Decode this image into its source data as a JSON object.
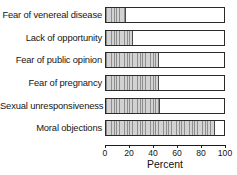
{
  "chart_data": {
    "type": "bar",
    "orientation": "horizontal",
    "title": "",
    "xlabel": "Percent",
    "ylabel": "",
    "xlim": [
      0,
      100
    ],
    "xticks": [
      0,
      20,
      40,
      60,
      80,
      100
    ],
    "grid": false,
    "legend": false,
    "bar_style": {
      "fill_pattern": "vertical-hatch",
      "fill_color": "#bcbcbc",
      "hatch_color": "#8e8e8e",
      "outline_color": "#2a2a2a",
      "track_color": "#ffffff"
    },
    "categories": [
      "Fear of venereal disease",
      "Lack of opportunity",
      "Fear of public opinion",
      "Fear of pregnancy",
      "Sexual unresponsiveness",
      "Moral objections"
    ],
    "values": [
      17,
      23,
      45,
      45,
      46,
      92
    ]
  },
  "axis": {
    "tick_labels": [
      "0",
      "20",
      "40",
      "60",
      "80",
      "100"
    ],
    "title": "Percent"
  }
}
